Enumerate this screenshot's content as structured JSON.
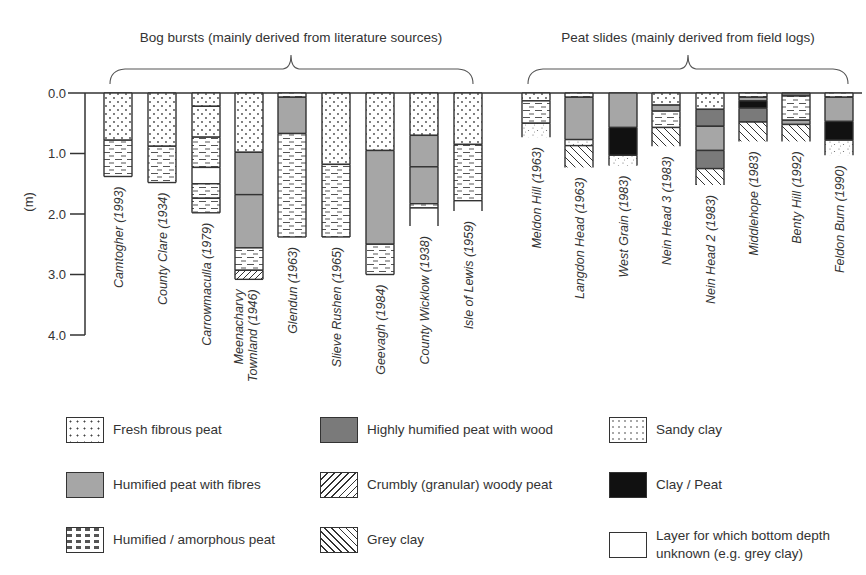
{
  "chart_data": {
    "type": "table",
    "ylabel": "(m)",
    "ylim": [
      0.0,
      4.0
    ],
    "yticks": [
      "0.0",
      "1.0",
      "2.0",
      "3.0",
      "4.0"
    ],
    "groups": [
      {
        "label": "Bog bursts (mainly derived from literature sources)"
      },
      {
        "label": "Peat slides (mainly derived from field logs)"
      }
    ],
    "columns": [
      {
        "name": "Camtogher (1993)",
        "group": 0,
        "layers": [
          {
            "material": "fresh",
            "top": 0.0,
            "bottom": 0.78
          },
          {
            "material": "amorph",
            "top": 0.78,
            "bottom": 1.38
          }
        ]
      },
      {
        "name": "County Clare (1934)",
        "group": 0,
        "layers": [
          {
            "material": "fresh",
            "top": 0.0,
            "bottom": 0.88
          },
          {
            "material": "amorph",
            "top": 0.88,
            "bottom": 1.48
          }
        ]
      },
      {
        "name": "Carrowmaculla (1979)",
        "group": 0,
        "layers": [
          {
            "material": "fresh",
            "top": 0.0,
            "bottom": 0.22
          },
          {
            "material": "fresh",
            "top": 0.22,
            "bottom": 0.73
          },
          {
            "material": "amorph",
            "top": 0.73,
            "bottom": 1.23
          },
          {
            "material": "unknown",
            "top": 1.23,
            "bottom": 1.5
          },
          {
            "material": "amorph",
            "top": 1.5,
            "bottom": 1.74
          },
          {
            "material": "amorph",
            "top": 1.74,
            "bottom": 1.98
          }
        ]
      },
      {
        "name": "Meenacharvy Townland (1946)",
        "group": 0,
        "layers": [
          {
            "material": "fresh",
            "top": 0.0,
            "bottom": 0.98
          },
          {
            "material": "humfib",
            "top": 0.98,
            "bottom": 1.68
          },
          {
            "material": "humfib",
            "top": 1.68,
            "bottom": 2.56
          },
          {
            "material": "amorph",
            "top": 2.56,
            "bottom": 2.93
          },
          {
            "material": "crumbly",
            "top": 2.93,
            "bottom": 3.08
          }
        ]
      },
      {
        "name": "Glendun (1963)",
        "group": 0,
        "layers": [
          {
            "material": "amorph",
            "top": 0.0,
            "bottom": 0.07
          },
          {
            "material": "humfib",
            "top": 0.07,
            "bottom": 0.67
          },
          {
            "material": "amorph",
            "top": 0.67,
            "bottom": 2.38
          }
        ]
      },
      {
        "name": "Slieve Rushen (1965)",
        "group": 0,
        "layers": [
          {
            "material": "fresh",
            "top": 0.0,
            "bottom": 1.18
          },
          {
            "material": "amorph",
            "top": 1.18,
            "bottom": 2.38
          }
        ]
      },
      {
        "name": "Geevagh (1984)",
        "group": 0,
        "layers": [
          {
            "material": "fresh",
            "top": 0.0,
            "bottom": 0.95
          },
          {
            "material": "humfib",
            "top": 0.95,
            "bottom": 2.5
          },
          {
            "material": "amorph",
            "top": 2.5,
            "bottom": 3.0
          }
        ]
      },
      {
        "name": "County Wicklow (1938)",
        "group": 0,
        "layers": [
          {
            "material": "fresh",
            "top": 0.0,
            "bottom": 0.7
          },
          {
            "material": "humfib",
            "top": 0.7,
            "bottom": 1.22
          },
          {
            "material": "humfib",
            "top": 1.22,
            "bottom": 1.83
          },
          {
            "material": "amorph",
            "top": 1.83,
            "bottom": 1.9
          },
          {
            "material": "unknown",
            "top": 1.9,
            "bottom": 2.2,
            "open": true
          }
        ]
      },
      {
        "name": "Isle of Lewis (1959)",
        "group": 0,
        "layers": [
          {
            "material": "fresh",
            "top": 0.0,
            "bottom": 0.85
          },
          {
            "material": "amorph",
            "top": 0.85,
            "bottom": 1.78
          },
          {
            "material": "unknown",
            "top": 1.78,
            "bottom": 1.95,
            "open": true
          }
        ]
      },
      {
        "name": "Meldon Hill (1963)",
        "group": 1,
        "layers": [
          {
            "material": "fresh",
            "top": 0.0,
            "bottom": 0.13
          },
          {
            "material": "amorph",
            "top": 0.13,
            "bottom": 0.5
          },
          {
            "material": "sandy",
            "top": 0.5,
            "bottom": 0.73,
            "open": true
          }
        ]
      },
      {
        "name": "Langdon Head (1963)",
        "group": 1,
        "layers": [
          {
            "material": "amorph",
            "top": 0.0,
            "bottom": 0.07
          },
          {
            "material": "humfib",
            "top": 0.07,
            "bottom": 0.77
          },
          {
            "material": "sandy",
            "top": 0.77,
            "bottom": 0.87
          },
          {
            "material": "greyclay",
            "top": 0.87,
            "bottom": 1.23,
            "open": true
          }
        ]
      },
      {
        "name": "West Grain (1983)",
        "group": 1,
        "layers": [
          {
            "material": "humfib",
            "top": 0.0,
            "bottom": 0.57
          },
          {
            "material": "claypeat",
            "top": 0.57,
            "bottom": 1.03
          },
          {
            "material": "sandy",
            "top": 1.03,
            "bottom": 1.2,
            "open": true
          }
        ]
      },
      {
        "name": "Nein Head 3 (1983)",
        "group": 1,
        "layers": [
          {
            "material": "fresh",
            "top": 0.0,
            "bottom": 0.2
          },
          {
            "material": "humfib",
            "top": 0.2,
            "bottom": 0.3
          },
          {
            "material": "amorph",
            "top": 0.3,
            "bottom": 0.57
          },
          {
            "material": "greyclay",
            "top": 0.57,
            "bottom": 0.88,
            "open": true
          }
        ]
      },
      {
        "name": "Nein Head 2 (1983)",
        "group": 1,
        "layers": [
          {
            "material": "fresh",
            "top": 0.0,
            "bottom": 0.27
          },
          {
            "material": "highwood",
            "top": 0.27,
            "bottom": 0.55
          },
          {
            "material": "humfib",
            "top": 0.55,
            "bottom": 0.95
          },
          {
            "material": "highwood",
            "top": 0.95,
            "bottom": 1.25
          },
          {
            "material": "greyclay",
            "top": 1.25,
            "bottom": 1.52,
            "open": true
          }
        ]
      },
      {
        "name": "Middlehope (1983)",
        "group": 1,
        "layers": [
          {
            "material": "amorph",
            "top": 0.0,
            "bottom": 0.07
          },
          {
            "material": "humfib",
            "top": 0.07,
            "bottom": 0.13
          },
          {
            "material": "claypeat",
            "top": 0.13,
            "bottom": 0.25
          },
          {
            "material": "highwood",
            "top": 0.25,
            "bottom": 0.48
          },
          {
            "material": "greyclay",
            "top": 0.48,
            "bottom": 0.8,
            "open": true
          }
        ]
      },
      {
        "name": "Benty Hill (1992)",
        "group": 1,
        "layers": [
          {
            "material": "highwood",
            "top": 0.0,
            "bottom": 0.05
          },
          {
            "material": "amorph",
            "top": 0.05,
            "bottom": 0.45
          },
          {
            "material": "humfib",
            "top": 0.45,
            "bottom": 0.52
          },
          {
            "material": "greyclay",
            "top": 0.52,
            "bottom": 0.8,
            "open": true
          }
        ]
      },
      {
        "name": "Feldon Burn (1990)",
        "group": 1,
        "layers": [
          {
            "material": "amorph",
            "top": 0.0,
            "bottom": 0.07
          },
          {
            "material": "humfib",
            "top": 0.07,
            "bottom": 0.47
          },
          {
            "material": "claypeat",
            "top": 0.47,
            "bottom": 0.78
          },
          {
            "material": "sandy",
            "top": 0.78,
            "bottom": 1.03,
            "open": true
          }
        ]
      }
    ],
    "legend": [
      {
        "key": "fresh",
        "label": "Fresh fibrous peat"
      },
      {
        "key": "humfib",
        "label": "Humified peat with fibres"
      },
      {
        "key": "amorph",
        "label": "Humified / amorphous peat"
      },
      {
        "key": "highwood",
        "label": "Highly humified peat with wood"
      },
      {
        "key": "crumbly",
        "label": "Crumbly (granular) woody peat"
      },
      {
        "key": "greyclay",
        "label": "Grey clay"
      },
      {
        "key": "sandy",
        "label": "Sandy clay"
      },
      {
        "key": "claypeat",
        "label": "Clay / Peat"
      },
      {
        "key": "unknown",
        "label": "Layer for which bottom depth unknown (e.g. grey clay)"
      }
    ],
    "colors": {
      "humfib": "#a6a6a6",
      "highwood": "#7a7a7a",
      "claypeat": "#111111",
      "line": "#333333"
    }
  }
}
